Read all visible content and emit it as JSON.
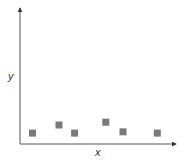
{
  "chart_data": {
    "type": "scatter",
    "title": "",
    "xlabel": "x",
    "ylabel": "y",
    "grid": false,
    "legend": null,
    "tick_labels": false,
    "marker": "square",
    "marker_color": "#7a7a7a",
    "axis_color": "#333333",
    "xlim": [
      0,
      10
    ],
    "ylim": [
      0,
      10
    ],
    "points": [
      {
        "x": 0.8,
        "y": 0.8
      },
      {
        "x": 2.5,
        "y": 1.4
      },
      {
        "x": 3.5,
        "y": 0.8
      },
      {
        "x": 5.5,
        "y": 1.6
      },
      {
        "x": 6.6,
        "y": 0.9
      },
      {
        "x": 8.8,
        "y": 0.8
      }
    ]
  }
}
